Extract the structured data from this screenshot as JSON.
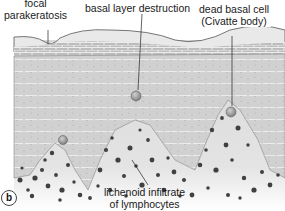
{
  "figure": {
    "panel_label": "b",
    "labels": {
      "focal_parakeratosis": [
        "focal",
        "parakeratosis"
      ],
      "basal_layer_destruction": "basal layer destruction",
      "dead_basal_cell": [
        "dead basal cell",
        "(Civatte body)"
      ],
      "lichenoid_infiltrate": [
        "lichenoid infiltrate",
        "of lymphocytes"
      ]
    },
    "colors": {
      "background": "#ffffff",
      "stratum_corneum": "#e6e6e6",
      "keratinocyte": "#d2d2d2",
      "cell_border": "#f5f5f5",
      "dermis": "#dcdcdc",
      "lymphocyte": "#444444",
      "civatte_body": "#9a9a9a",
      "text": "#1a1a1a"
    }
  }
}
